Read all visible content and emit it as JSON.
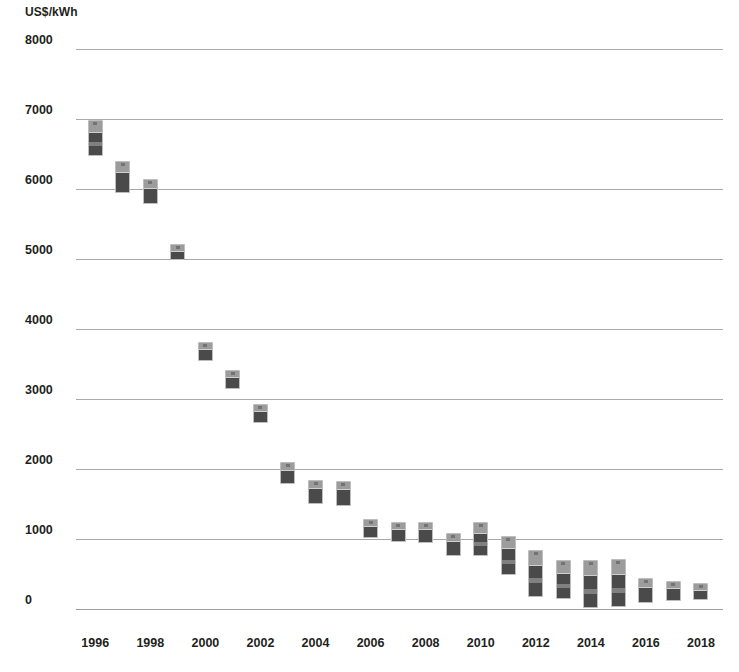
{
  "chart_data": {
    "type": "bar",
    "title": "",
    "subtitle": "",
    "ylabel": "US$/kWh",
    "xlabel": "",
    "ylim": [
      0,
      8000
    ],
    "ytick_labels": [
      "8000",
      "7000",
      "6000",
      "5000",
      "4000",
      "3000",
      "2000",
      "1000",
      "0"
    ],
    "ytick_values": [
      8000,
      7000,
      6000,
      5000,
      4000,
      3000,
      2000,
      1000,
      0
    ],
    "xtick_labels": [
      "1996",
      "1998",
      "2000",
      "2002",
      "2004",
      "2006",
      "2008",
      "2010",
      "2012",
      "2014",
      "2016",
      "2018"
    ],
    "xtick_values": [
      1996,
      1998,
      2000,
      2002,
      2004,
      2006,
      2008,
      2010,
      2012,
      2014,
      2016,
      2018
    ],
    "xlim": [
      1995.3,
      2018.8
    ],
    "grid": true,
    "legend": false,
    "marker_style": "battery-icon",
    "colors": {
      "marker_body": "#4a4a4a",
      "marker_cap": "#9c9c9c",
      "marker_outline": "#bdbdbd",
      "gridline": "#9a9a9a",
      "text": "#231f20"
    },
    "categories": [
      1996,
      1997,
      1998,
      1999,
      2000,
      2001,
      2002,
      2003,
      2004,
      2005,
      2006,
      2007,
      2008,
      2009,
      2010,
      2011,
      2012,
      2013,
      2014,
      2015,
      2016,
      2017,
      2018
    ],
    "series": [
      {
        "name": "range_high",
        "values": [
          6985,
          6400,
          6140,
          5220,
          3810,
          3410,
          2930,
          2100,
          1850,
          1830,
          1290,
          1240,
          1250,
          1090,
          1250,
          1050,
          840,
          700,
          700,
          710,
          440,
          400,
          370
        ]
      },
      {
        "name": "range_low",
        "values": [
          6470,
          5940,
          5790,
          4980,
          3540,
          3140,
          2650,
          1780,
          1500,
          1470,
          1020,
          950,
          950,
          760,
          760,
          480,
          170,
          140,
          10,
          30,
          90,
          110,
          130
        ]
      }
    ],
    "points": [
      {
        "year": 1996,
        "high": 6985,
        "low": 6470
      },
      {
        "year": 1997,
        "high": 6400,
        "low": 5940
      },
      {
        "year": 1998,
        "high": 6140,
        "low": 5790
      },
      {
        "year": 1999,
        "high": 5220,
        "low": 4980
      },
      {
        "year": 2000,
        "high": 3810,
        "low": 3540
      },
      {
        "year": 2001,
        "high": 3410,
        "low": 3140
      },
      {
        "year": 2002,
        "high": 2930,
        "low": 2650
      },
      {
        "year": 2003,
        "high": 2100,
        "low": 1780
      },
      {
        "year": 2004,
        "high": 1850,
        "low": 1500
      },
      {
        "year": 2005,
        "high": 1830,
        "low": 1470
      },
      {
        "year": 2006,
        "high": 1290,
        "low": 1020
      },
      {
        "year": 2007,
        "high": 1240,
        "low": 950
      },
      {
        "year": 2008,
        "high": 1250,
        "low": 950
      },
      {
        "year": 2009,
        "high": 1090,
        "low": 760
      },
      {
        "year": 2010,
        "high": 1250,
        "low": 760
      },
      {
        "year": 2011,
        "high": 1050,
        "low": 480
      },
      {
        "year": 2012,
        "high": 840,
        "low": 170
      },
      {
        "year": 2013,
        "high": 700,
        "low": 140
      },
      {
        "year": 2014,
        "high": 700,
        "low": 10
      },
      {
        "year": 2015,
        "high": 710,
        "low": 30
      },
      {
        "year": 2016,
        "high": 440,
        "low": 90
      },
      {
        "year": 2017,
        "high": 400,
        "low": 110
      },
      {
        "year": 2018,
        "high": 370,
        "low": 130
      }
    ]
  }
}
